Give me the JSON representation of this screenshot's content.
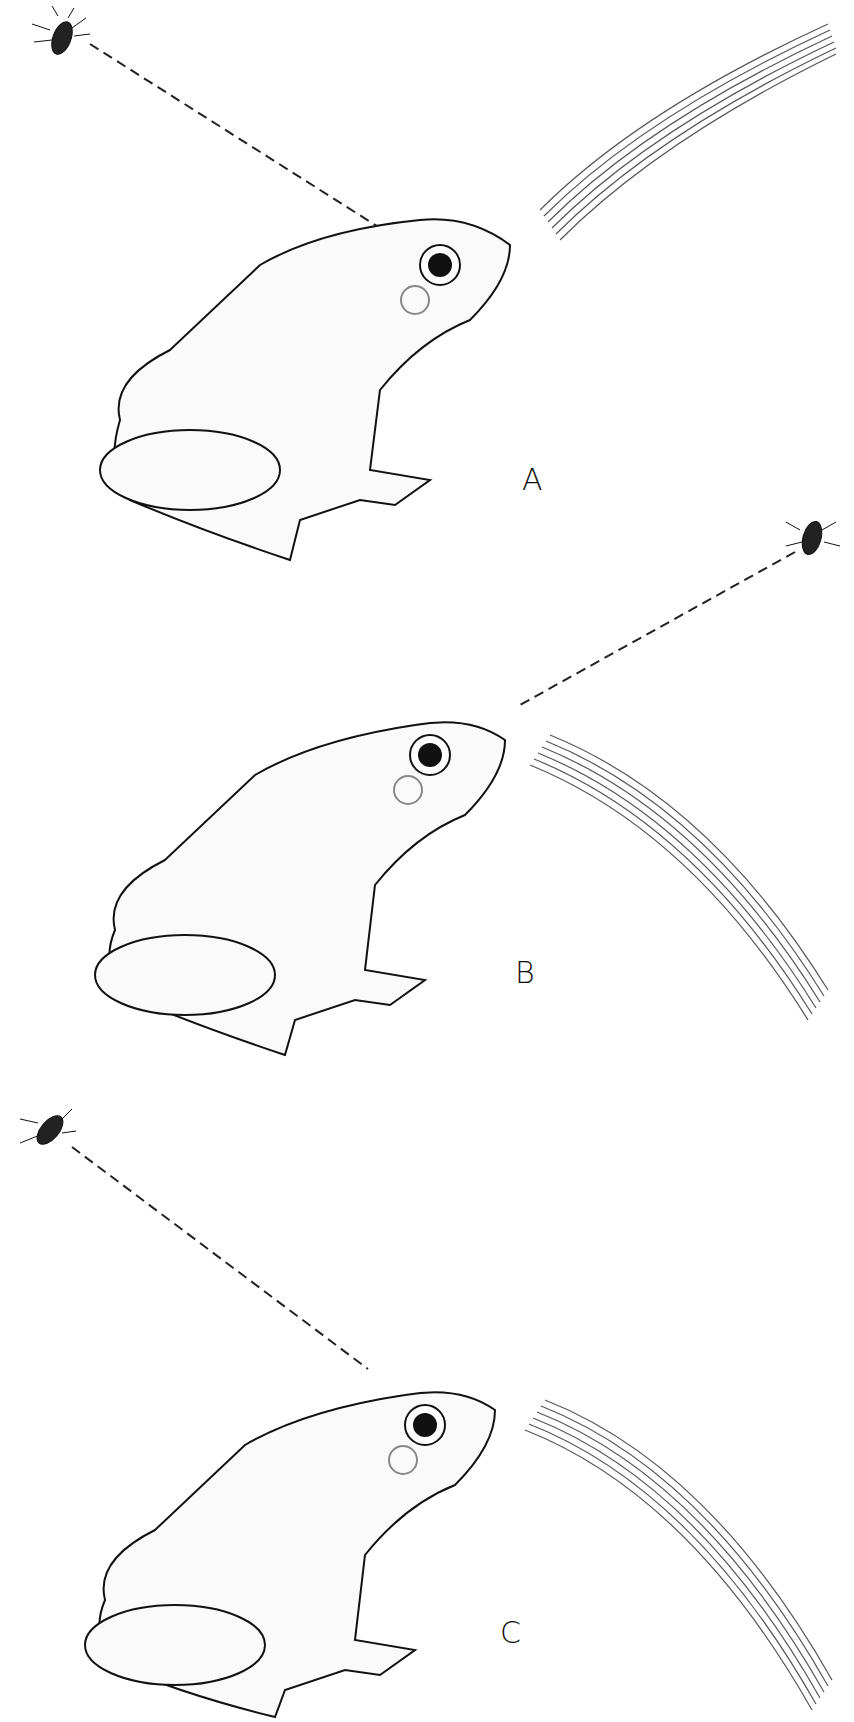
{
  "figure": {
    "panels": [
      {
        "label": "A",
        "fly_position": "upper-left",
        "stripe_direction": "upper-right"
      },
      {
        "label": "B",
        "fly_position": "upper-right",
        "stripe_direction": "lower-right"
      },
      {
        "label": "C",
        "fly_position": "upper-left",
        "stripe_direction": "lower-right"
      }
    ]
  }
}
